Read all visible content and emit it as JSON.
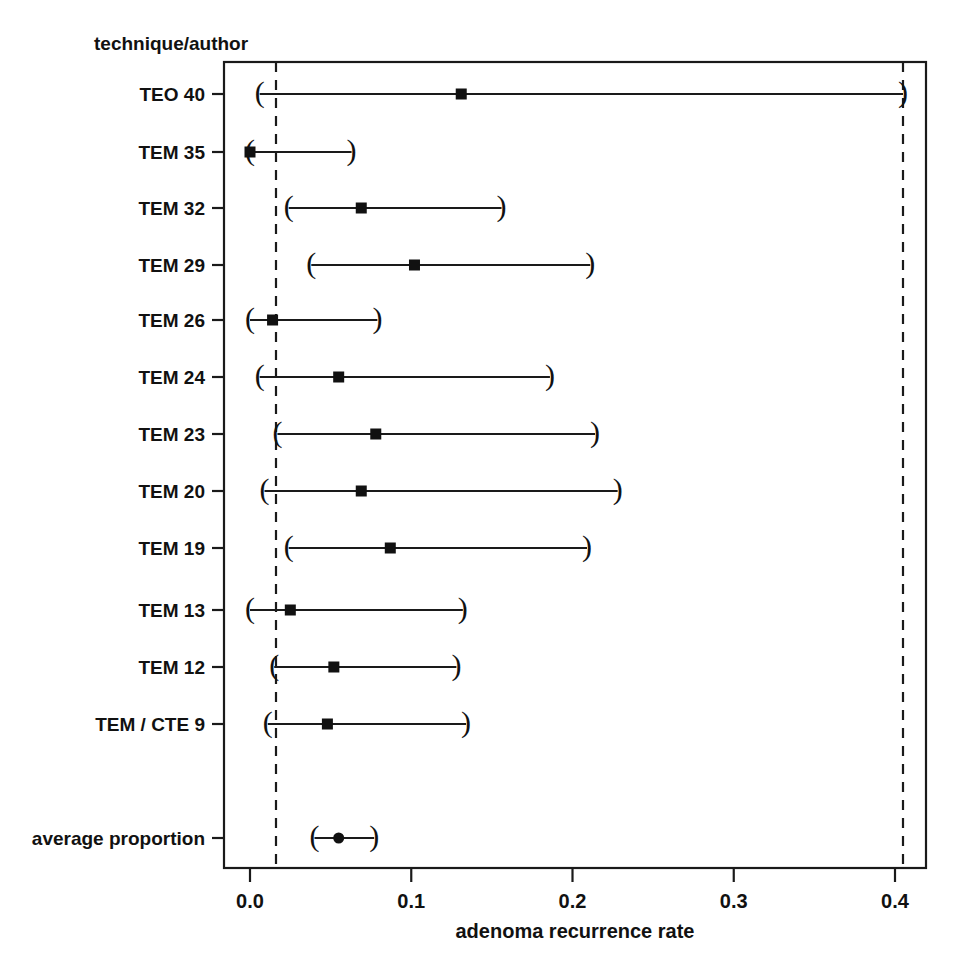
{
  "figure": {
    "column_header": "technique/author",
    "x_axis_label": "adenoma recurrence rate",
    "x_ticks": [
      "0.0",
      "0.1",
      "0.2",
      "0.3",
      "0.4"
    ],
    "line_color": "#1a1a1a",
    "text_color": "#111111",
    "background": "#ffffff"
  },
  "chart_data": {
    "type": "scatter",
    "title": "",
    "subtitle": "",
    "xlabel": "adenoma recurrence rate",
    "ylabel": "technique/author",
    "xlim": [
      -0.016,
      0.42
    ],
    "xticks": [
      0.0,
      0.1,
      0.2,
      0.3,
      0.4
    ],
    "xticklabels": [
      "0.0",
      "0.1",
      "0.2",
      "0.3",
      "0.4"
    ],
    "grid": false,
    "legend": null,
    "orientation": "horizontal",
    "plot_style": "forest plot",
    "reference_lines": [
      0.016,
      0.405
    ],
    "categories": [
      "TEO 40",
      "TEM 35",
      "TEM 32",
      "TEM 29",
      "TEM 26",
      "TEM 24",
      "TEM 23",
      "TEM 20",
      "TEM 19",
      "TEM 13",
      "TEM 12",
      "TEM / CTE 9",
      "average proportion"
    ],
    "points": [
      {
        "label": "TEO 40",
        "estimate": 0.131,
        "ci_low": 0.006,
        "ci_high": 0.405,
        "marker": "square"
      },
      {
        "label": "TEM 35",
        "estimate": 0.0,
        "ci_low": 0.0,
        "ci_high": 0.063,
        "marker": "square"
      },
      {
        "label": "TEM 32",
        "estimate": 0.069,
        "ci_low": 0.024,
        "ci_high": 0.156,
        "marker": "square"
      },
      {
        "label": "TEM 29",
        "estimate": 0.102,
        "ci_low": 0.038,
        "ci_high": 0.211,
        "marker": "square"
      },
      {
        "label": "TEM 26",
        "estimate": 0.014,
        "ci_low": 0.0,
        "ci_high": 0.079,
        "marker": "square"
      },
      {
        "label": "TEM 24",
        "estimate": 0.055,
        "ci_low": 0.006,
        "ci_high": 0.186,
        "marker": "square"
      },
      {
        "label": "TEM 23",
        "estimate": 0.078,
        "ci_low": 0.017,
        "ci_high": 0.214,
        "marker": "square"
      },
      {
        "label": "TEM 20",
        "estimate": 0.069,
        "ci_low": 0.009,
        "ci_high": 0.228,
        "marker": "square"
      },
      {
        "label": "TEM 19",
        "estimate": 0.087,
        "ci_low": 0.024,
        "ci_high": 0.209,
        "marker": "square"
      },
      {
        "label": "TEM 13",
        "estimate": 0.025,
        "ci_low": 0.0,
        "ci_high": 0.132,
        "marker": "square"
      },
      {
        "label": "TEM 12",
        "estimate": 0.052,
        "ci_low": 0.015,
        "ci_high": 0.128,
        "marker": "square"
      },
      {
        "label": "TEM / CTE 9",
        "estimate": 0.048,
        "ci_low": 0.011,
        "ci_high": 0.134,
        "marker": "square"
      },
      {
        "label": "average proportion",
        "estimate": 0.055,
        "ci_low": 0.04,
        "ci_high": 0.077,
        "marker": "circle"
      }
    ]
  }
}
